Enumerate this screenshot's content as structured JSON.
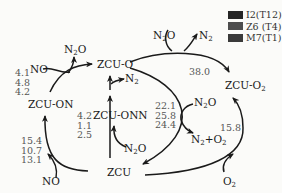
{
  "legend": {
    "items": [
      {
        "label": "I2(T12)",
        "color": "#262626"
      },
      {
        "label": "Z6 (T4)",
        "color": "#4d4d4d"
      },
      {
        "label": "M7(T1)",
        "color": "#3a3a3a"
      }
    ]
  },
  "species": {
    "zcu_o": "ZCU-O",
    "zcu_on": "ZCU-ON",
    "zcu_onn": "ZCU-ONN",
    "zcu": "ZCU",
    "zcu_o2_base": "ZCU-O",
    "zcu_o2_sub": "2"
  },
  "molecules": {
    "n2o_top_left": {
      "base": "N",
      "sub": "2",
      "tail": "O"
    },
    "no_top_left": "NO",
    "n2_mid": {
      "base": "N",
      "sub": "2"
    },
    "n2o_top_right": {
      "base": "N",
      "sub": "2",
      "tail": "O"
    },
    "n2_top_right": {
      "base": "N",
      "sub": "2"
    },
    "n2o_right": {
      "base": "N",
      "sub": "2",
      "tail": "O"
    },
    "n2_o2_product": {
      "a": "N",
      "a_sub": "2",
      "plus": "+O",
      "b_sub": "2"
    },
    "n2o_bottom": {
      "base": "N",
      "sub": "2",
      "tail": "O"
    },
    "no_bottom": "NO",
    "o2_bottom": {
      "base": "O",
      "sub": "2"
    }
  },
  "barriers": {
    "on_to_o": [
      "4.1",
      "4.8",
      "4.2"
    ],
    "zcu_to_on": [
      "15.4",
      "10.7",
      "13.1"
    ],
    "zcu_to_onn": [
      "4.2",
      "1.1",
      "2.5"
    ],
    "o_to_zcu": [
      "22.1",
      "25.8",
      "24.4"
    ],
    "o_to_o2": "38.0",
    "zcu_to_o2": "15.8"
  }
}
